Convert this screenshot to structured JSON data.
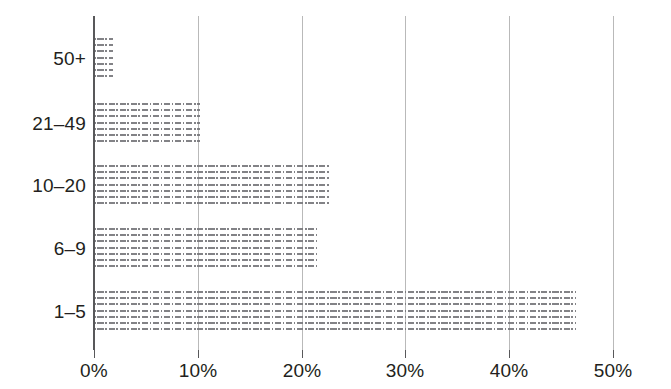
{
  "chart_data": {
    "type": "bar",
    "orientation": "horizontal",
    "title": "",
    "subtitle": "",
    "xlabel": "",
    "ylabel": "",
    "categories": [
      "1–5",
      "6–9",
      "10–20",
      "21–49",
      "50+"
    ],
    "values": [
      46.4,
      21.5,
      22.7,
      10.2,
      1.8
    ],
    "value_labels": [
      "46.4%",
      "21.5%",
      "22.7%",
      "10.2%",
      "1.8%"
    ],
    "xlim": [
      0,
      50
    ],
    "xticks": [
      0,
      10,
      20,
      30,
      40,
      50
    ],
    "xtick_labels": [
      "0%",
      "10%",
      "20%",
      "30%",
      "40%",
      "50%"
    ],
    "grid": true,
    "grid_axis": "x",
    "legend": null,
    "series": [
      {
        "name": "",
        "values": [
          46.4,
          21.5,
          22.7,
          10.2,
          1.8
        ]
      }
    ],
    "colors": {
      "bar_fill": "#78787c",
      "bar_pattern": "dashed-horizontal-hatch",
      "gridline": "#b9b9b9",
      "axis": "#58585a",
      "text": "#231f20",
      "background": "#ffffff"
    }
  },
  "axes": {
    "y_categories": [
      {
        "label": "50+"
      },
      {
        "label": "21–49"
      },
      {
        "label": "10–20"
      },
      {
        "label": "6–9"
      },
      {
        "label": "1–5"
      }
    ],
    "x_ticks": [
      {
        "label": "0%",
        "value": 0
      },
      {
        "label": "10%",
        "value": 10
      },
      {
        "label": "20%",
        "value": 20
      },
      {
        "label": "30%",
        "value": 30
      },
      {
        "label": "40%",
        "value": 40
      },
      {
        "label": "50%",
        "value": 50
      }
    ]
  }
}
